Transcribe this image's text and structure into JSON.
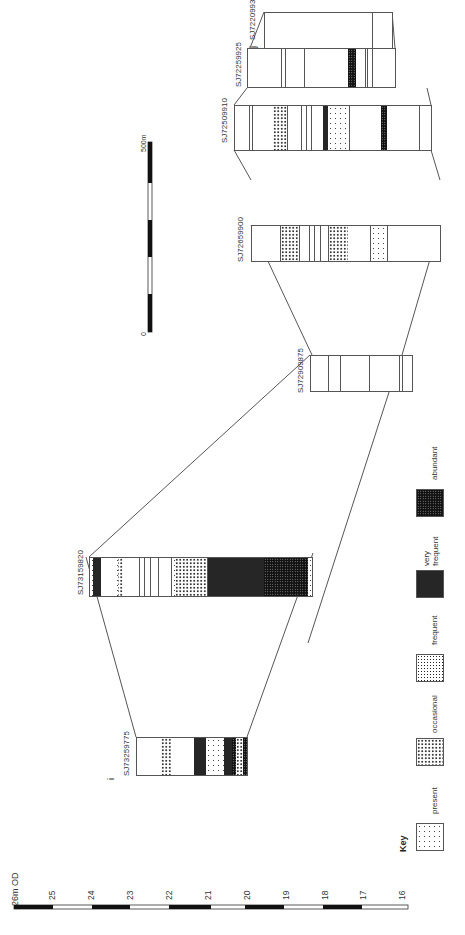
{
  "diagram": {
    "orientation": "rotated-90-ccw",
    "depth_scale": {
      "top_label": "26m OD",
      "ticks": [
        "25",
        "24",
        "23",
        "22",
        "21",
        "20",
        "19",
        "18",
        "17",
        "16"
      ]
    },
    "distance_scale": {
      "start_label": "0",
      "end_label": "500m"
    },
    "key": {
      "title": "Key",
      "items": [
        {
          "label": "present",
          "pattern": "present"
        },
        {
          "label": "occasional",
          "pattern": "occasional"
        },
        {
          "label": "frequent",
          "pattern": "frequent"
        },
        {
          "label": "very frequent",
          "pattern": "very-frequent"
        },
        {
          "label": "abundant",
          "pattern": "abundant"
        }
      ]
    },
    "boreholes": [
      {
        "id": "SJ73259775",
        "marker": "i"
      },
      {
        "id": "SJ73159820"
      },
      {
        "id": "SJ72909875"
      },
      {
        "id": "SJ72659900"
      },
      {
        "id": "SJ72509910"
      },
      {
        "id": "SJ72259925"
      },
      {
        "id": "SJ72209930",
        "marker": "j"
      }
    ]
  }
}
